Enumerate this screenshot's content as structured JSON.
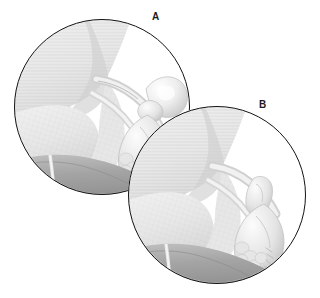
{
  "figure": {
    "type": "medical-anatomical-illustration",
    "background_color": "#ffffff",
    "outline_color": "#131313",
    "panel_count": 2,
    "composition": "two overlapping circular inset views; panel B overlaps panel A at lower right"
  },
  "panels": [
    {
      "id": "a",
      "label": "A",
      "label_position": {
        "x": 152,
        "y": 12
      },
      "circle": {
        "cx": 102,
        "cy": 107,
        "r": 88
      },
      "description": "Circular cut-away view of pelvic anatomy showing inguinal region with a rounded bulging sac at upper right connected by a narrow neck to the canal",
      "tissue_tone": "#e9e9e9",
      "shadow_tone": "#b9b9b9",
      "floor_tone": "#a6a6a6"
    },
    {
      "id": "b",
      "label": "B",
      "label_position": {
        "x": 259,
        "y": 100
      },
      "circle": {
        "cx": 217,
        "cy": 195,
        "r": 89
      },
      "description": "Circular cut-away view of the same pelvic region after reduction; the rounded sac is absent and the canal structure is narrowed and closed",
      "tissue_tone": "#e9e9e9",
      "shadow_tone": "#b9b9b9",
      "floor_tone": "#a6a6a6"
    }
  ],
  "palette": {
    "outline": "#131313",
    "paper": "#ffffff",
    "tissue_light": "#f2f2f2",
    "tissue_mid": "#e1e1e1",
    "tissue_shade": "#c9c9c9",
    "tissue_deep": "#ababab",
    "floor_dark": "#9d9d9d",
    "line_texture": "#d6d6d6",
    "label_text": "#1a1a1a"
  }
}
